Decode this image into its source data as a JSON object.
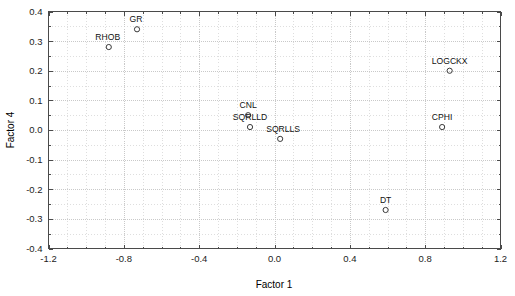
{
  "chart_data": {
    "type": "scatter",
    "title": "",
    "xlabel": "Factor 1",
    "ylabel": "Factor 4",
    "xlim": [
      -1.2,
      1.2
    ],
    "ylim": [
      -0.4,
      0.4
    ],
    "xticks": [
      "-1.2",
      "-0.8",
      "-0.4",
      "0.0",
      "0.4",
      "0.8",
      "1.2"
    ],
    "xtick_values": [
      -1.2,
      -0.8,
      -0.4,
      0.0,
      0.4,
      0.8,
      1.2
    ],
    "yticks": [
      "0.4",
      "0.3",
      "0.2",
      "0.1",
      "0.0",
      "-0.1",
      "-0.2",
      "-0.3",
      "-0.4"
    ],
    "ytick_values": [
      0.4,
      0.3,
      0.2,
      0.1,
      0.0,
      -0.1,
      -0.2,
      -0.3,
      -0.4
    ],
    "grid": true,
    "legend": "none",
    "marker_style": "open-circle",
    "points": [
      {
        "label": "RHOB",
        "x": -0.88,
        "y": 0.28,
        "label_dx": -1,
        "label_dy": -7
      },
      {
        "label": "GR",
        "x": -0.73,
        "y": 0.34,
        "label_dx": -1,
        "label_dy": -7
      },
      {
        "label": "CNL",
        "x": -0.14,
        "y": 0.05,
        "label_dx": 0,
        "label_dy": -7
      },
      {
        "label": "SQRLLD",
        "x": -0.13,
        "y": 0.01,
        "label_dx": 0,
        "label_dy": -7
      },
      {
        "label": "SQRLLS",
        "x": 0.03,
        "y": -0.03,
        "label_dx": 3,
        "label_dy": -7
      },
      {
        "label": "LOGCKX",
        "x": 0.93,
        "y": 0.2,
        "label_dx": 0,
        "label_dy": -7
      },
      {
        "label": "CPHI",
        "x": 0.89,
        "y": 0.01,
        "label_dx": 0,
        "label_dy": -7
      },
      {
        "label": "DT",
        "x": 0.59,
        "y": -0.27,
        "label_dx": 0,
        "label_dy": -7
      }
    ]
  },
  "colors": {
    "frame": "#4a4a4a",
    "grid_major": "#c9c9c9",
    "grid_minor": "#dedede",
    "marker_stroke": "#3a3a3a",
    "text": "#111111",
    "background": "#ffffff"
  }
}
